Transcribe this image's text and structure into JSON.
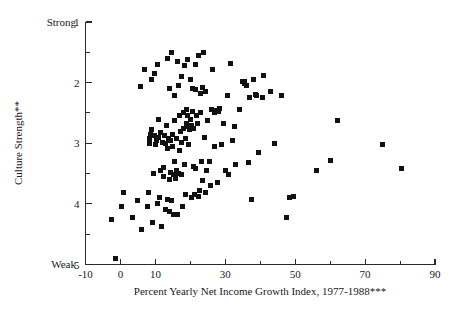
{
  "chart_data": {
    "type": "scatter",
    "title": "",
    "xlabel": "Percent Yearly Net Income Growth Index, 1977-1988***",
    "ylabel": "Culture Strength**",
    "xlim": [
      -10,
      90
    ],
    "ylim": [
      1,
      5
    ],
    "y_axis_inverted": true,
    "grid": false,
    "legend": null,
    "x_ticks_major": [
      -10,
      0,
      10,
      30,
      50,
      70,
      90
    ],
    "x_tick_labels": [
      "-10",
      "0",
      "10",
      "30",
      "50",
      "70",
      "90"
    ],
    "x_ticks_minor": [
      20,
      40,
      60,
      80
    ],
    "y_ticks_major": [
      1,
      2,
      3,
      4,
      5
    ],
    "y_tick_labels": [
      "1",
      "2",
      "3",
      "4",
      "5"
    ],
    "y_ticks_minor": [
      1.5,
      2.5,
      3.5,
      4.5
    ],
    "y_end_label_top": "Strong",
    "y_end_label_bottom": "Weak",
    "marker": "square",
    "marker_color": "#111111",
    "marker_size_px": 5,
    "points": [
      [
        -2.5,
        4.25
      ],
      [
        -1.5,
        4.9
      ],
      [
        0.2,
        4.05
      ],
      [
        1.0,
        3.82
      ],
      [
        3.5,
        4.22
      ],
      [
        5.0,
        3.95
      ],
      [
        5.6,
        2.06
      ],
      [
        6.0,
        4.42
      ],
      [
        6.8,
        1.78
      ],
      [
        7.6,
        4.05
      ],
      [
        8.0,
        3.82
      ],
      [
        8.2,
        3.0
      ],
      [
        8.4,
        2.92
      ],
      [
        8.5,
        2.85
      ],
      [
        8.8,
        1.95
      ],
      [
        9.0,
        2.78
      ],
      [
        9.3,
        4.3
      ],
      [
        9.5,
        3.5
      ],
      [
        9.6,
        2.88
      ],
      [
        9.8,
        1.85
      ],
      [
        10.0,
        3.02
      ],
      [
        10.2,
        2.95
      ],
      [
        10.5,
        1.7
      ],
      [
        10.6,
        4.0
      ],
      [
        10.8,
        2.6
      ],
      [
        11.0,
        2.9
      ],
      [
        11.2,
        3.9
      ],
      [
        11.4,
        3.45
      ],
      [
        11.6,
        2.82
      ],
      [
        11.8,
        4.38
      ],
      [
        12.0,
        2.98
      ],
      [
        12.2,
        3.55
      ],
      [
        12.4,
        3.4
      ],
      [
        12.6,
        2.88
      ],
      [
        12.8,
        4.1
      ],
      [
        13.0,
        3.0
      ],
      [
        13.2,
        2.7
      ],
      [
        13.4,
        1.6
      ],
      [
        13.5,
        3.92
      ],
      [
        13.6,
        3.08
      ],
      [
        13.8,
        2.92
      ],
      [
        13.9,
        2.1
      ],
      [
        14.0,
        3.6
      ],
      [
        14.1,
        4.12
      ],
      [
        14.2,
        3.48
      ],
      [
        14.4,
        2.95
      ],
      [
        14.5,
        3.95
      ],
      [
        14.6,
        1.5
      ],
      [
        14.8,
        3.05
      ],
      [
        15.0,
        2.86
      ],
      [
        15.1,
        3.52
      ],
      [
        15.2,
        4.18
      ],
      [
        15.4,
        2.62
      ],
      [
        15.5,
        3.3
      ],
      [
        15.6,
        2.22
      ],
      [
        15.8,
        3.58
      ],
      [
        16.0,
        2.92
      ],
      [
        16.1,
        3.45
      ],
      [
        16.2,
        4.18
      ],
      [
        16.4,
        1.65
      ],
      [
        16.5,
        2.05
      ],
      [
        16.6,
        3.5
      ],
      [
        16.8,
        2.55
      ],
      [
        17.0,
        3.12
      ],
      [
        17.2,
        2.8
      ],
      [
        17.4,
        3.52
      ],
      [
        17.5,
        1.9
      ],
      [
        17.6,
        2.98
      ],
      [
        17.8,
        4.05
      ],
      [
        18.0,
        2.5
      ],
      [
        18.1,
        2.75
      ],
      [
        18.2,
        3.35
      ],
      [
        18.4,
        1.72
      ],
      [
        18.5,
        2.92
      ],
      [
        18.6,
        3.85
      ],
      [
        18.8,
        2.45
      ],
      [
        19.0,
        2.68
      ],
      [
        19.2,
        2.55
      ],
      [
        19.3,
        1.62
      ],
      [
        19.4,
        3.02
      ],
      [
        19.6,
        2.72
      ],
      [
        19.8,
        2.78
      ],
      [
        20.0,
        1.95
      ],
      [
        20.1,
        2.6
      ],
      [
        20.2,
        2.7
      ],
      [
        20.4,
        3.9
      ],
      [
        20.5,
        2.1
      ],
      [
        20.6,
        2.48
      ],
      [
        20.8,
        3.38
      ],
      [
        21.0,
        2.75
      ],
      [
        21.2,
        3.85
      ],
      [
        21.4,
        1.7
      ],
      [
        21.5,
        2.12
      ],
      [
        21.6,
        3.42
      ],
      [
        21.8,
        2.55
      ],
      [
        22.0,
        2.68
      ],
      [
        22.2,
        3.88
      ],
      [
        22.4,
        1.55
      ],
      [
        22.6,
        3.78
      ],
      [
        22.8,
        2.18
      ],
      [
        23.0,
        2.5
      ],
      [
        23.2,
        3.3
      ],
      [
        23.4,
        2.08
      ],
      [
        23.6,
        3.62
      ],
      [
        23.8,
        1.5
      ],
      [
        24.0,
        2.9
      ],
      [
        24.2,
        3.82
      ],
      [
        24.4,
        2.15
      ],
      [
        24.6,
        3.45
      ],
      [
        25.0,
        2.62
      ],
      [
        25.4,
        3.3
      ],
      [
        25.8,
        3.7
      ],
      [
        26.0,
        2.45
      ],
      [
        26.4,
        1.78
      ],
      [
        26.8,
        2.5
      ],
      [
        27.0,
        3.05
      ],
      [
        27.4,
        2.46
      ],
      [
        27.8,
        3.65
      ],
      [
        28.0,
        2.48
      ],
      [
        28.4,
        2.42
      ],
      [
        29.0,
        3.02
      ],
      [
        29.4,
        2.68
      ],
      [
        30.0,
        3.45
      ],
      [
        30.5,
        2.22
      ],
      [
        31.0,
        3.52
      ],
      [
        31.5,
        1.68
      ],
      [
        32.0,
        2.95
      ],
      [
        32.5,
        2.72
      ],
      [
        33.0,
        3.35
      ],
      [
        34.0,
        2.45
      ],
      [
        35.0,
        1.98
      ],
      [
        35.4,
        2.02
      ],
      [
        35.6,
        1.98
      ],
      [
        36.0,
        2.05
      ],
      [
        36.5,
        3.32
      ],
      [
        37.0,
        2.25
      ],
      [
        37.5,
        3.92
      ],
      [
        38.0,
        1.95
      ],
      [
        38.5,
        2.2
      ],
      [
        39.0,
        2.22
      ],
      [
        39.5,
        3.15
      ],
      [
        40.5,
        2.25
      ],
      [
        41.0,
        1.88
      ],
      [
        43.0,
        2.15
      ],
      [
        44.0,
        3.0
      ],
      [
        46.0,
        2.22
      ],
      [
        47.5,
        4.22
      ],
      [
        48.5,
        3.9
      ],
      [
        49.5,
        3.88
      ],
      [
        56.0,
        3.45
      ],
      [
        60.0,
        3.28
      ],
      [
        62.0,
        2.62
      ],
      [
        75.0,
        3.02
      ],
      [
        80.5,
        3.42
      ]
    ]
  }
}
